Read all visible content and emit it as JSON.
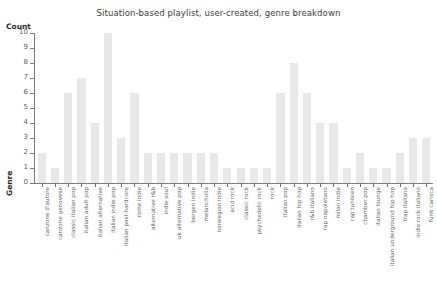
{
  "chart_data": {
    "type": "bar",
    "title": "Situation-based playlist, user-created, genre breakdown",
    "xlabel": "Genre",
    "ylabel": "Count",
    "ylim": [
      0,
      10
    ],
    "yticks": [
      0,
      1,
      2,
      3,
      4,
      5,
      6,
      7,
      8,
      9,
      10
    ],
    "grid": false,
    "legend": "none",
    "bar_color": "#e8e8e8",
    "categories": [
      "canzone d'autore",
      "canzone genovese",
      "classic italian pop",
      "italian adult pop",
      "italian alternative",
      "italian indie pop",
      "italian post-hardcore",
      "rome indie",
      "alternative r&b",
      "indie soul",
      "uk alternative pop",
      "bergen indie",
      "melancholia",
      "norwegian indie",
      "acid rock",
      "classic rock",
      "psychedelic rock",
      "rock",
      "italian pop",
      "italian hip hop",
      "r&b italiano",
      "rap napoletano",
      "milan indie",
      "rap tunisien",
      "chamber pop",
      "italian lounge",
      "italian underground hip hop",
      "trap italiana",
      "indie rock italiano",
      "funk carioca"
    ],
    "values": [
      2,
      1,
      6,
      7,
      4,
      10,
      3,
      6,
      2,
      2,
      2,
      2,
      2,
      2,
      1,
      1,
      1,
      1,
      6,
      8,
      6,
      4,
      4,
      1,
      2,
      1,
      1,
      2,
      3,
      3
    ]
  }
}
